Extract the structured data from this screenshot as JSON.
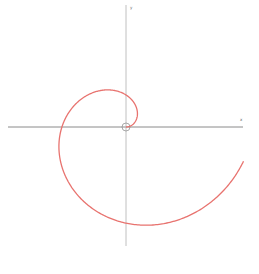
{
  "diagram": {
    "type": "parametric-plot",
    "axes": {
      "x_label": "x",
      "y_label": "y",
      "color": "#8a8a8a"
    },
    "curve": {
      "name": "spiral",
      "color": "#e8736f",
      "equation": "r = a·θ",
      "theta_start": 0,
      "theta_end_rad": 6.0
    },
    "origin_marker": "circle"
  },
  "chart_data": {
    "type": "line",
    "title": "",
    "xlabel": "x",
    "ylabel": "y",
    "grid": false,
    "series": [
      {
        "name": "spiral r = a·θ",
        "color": "#e8736f",
        "points_px_relative_to_origin": [
          [
            0,
            0
          ],
          [
            10,
            -29
          ],
          [
            0,
            -32
          ],
          [
            -27,
            -27
          ],
          [
            -64,
            0
          ],
          [
            -56,
            56
          ],
          [
            0,
            96
          ],
          [
            48,
            83
          ],
          [
            120,
            16
          ]
        ]
      }
    ]
  }
}
